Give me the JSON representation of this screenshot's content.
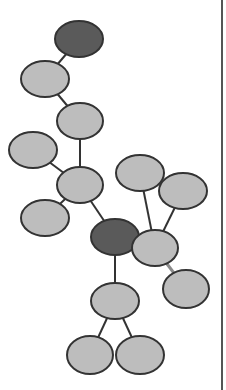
{
  "diagram": {
    "type": "tree-graph",
    "colors": {
      "background": "#ffffff",
      "node_light": "#bdbdbd",
      "node_dark": "#5a5a5a",
      "stroke": "#333333",
      "soft_edge": "#8a8a8a",
      "frame": "#555555"
    },
    "nodes": [
      {
        "id": 1,
        "cx": 79,
        "cy": 39,
        "rx": 24,
        "ry": 18,
        "shade": "dark"
      },
      {
        "id": 2,
        "cx": 45,
        "cy": 79,
        "rx": 24,
        "ry": 18,
        "shade": "light"
      },
      {
        "id": 3,
        "cx": 80,
        "cy": 121,
        "rx": 23,
        "ry": 18,
        "shade": "light"
      },
      {
        "id": 4,
        "cx": 33,
        "cy": 150,
        "rx": 24,
        "ry": 18,
        "shade": "light"
      },
      {
        "id": 5,
        "cx": 80,
        "cy": 185,
        "rx": 23,
        "ry": 18,
        "shade": "light"
      },
      {
        "id": 6,
        "cx": 45,
        "cy": 218,
        "rx": 24,
        "ry": 18,
        "shade": "light"
      },
      {
        "id": 7,
        "cx": 140,
        "cy": 173,
        "rx": 24,
        "ry": 18,
        "shade": "light"
      },
      {
        "id": 8,
        "cx": 183,
        "cy": 191,
        "rx": 24,
        "ry": 18,
        "shade": "light"
      },
      {
        "id": 9,
        "cx": 115,
        "cy": 237,
        "rx": 24,
        "ry": 18,
        "shade": "dark"
      },
      {
        "id": 10,
        "cx": 155,
        "cy": 248,
        "rx": 23,
        "ry": 18,
        "shade": "light"
      },
      {
        "id": 11,
        "cx": 186,
        "cy": 289,
        "rx": 23,
        "ry": 19,
        "shade": "light"
      },
      {
        "id": 12,
        "cx": 115,
        "cy": 301,
        "rx": 24,
        "ry": 18,
        "shade": "light"
      },
      {
        "id": 13,
        "cx": 90,
        "cy": 355,
        "rx": 23,
        "ry": 19,
        "shade": "light"
      },
      {
        "id": 14,
        "cx": 140,
        "cy": 355,
        "rx": 24,
        "ry": 19,
        "shade": "light"
      }
    ],
    "edges": [
      {
        "from": 1,
        "to": 2
      },
      {
        "from": 2,
        "to": 3
      },
      {
        "from": 3,
        "to": 5
      },
      {
        "from": 4,
        "to": 5
      },
      {
        "from": 5,
        "to": 6
      },
      {
        "from": 5,
        "to": 9
      },
      {
        "from": 9,
        "to": 10
      },
      {
        "from": 9,
        "to": 12
      },
      {
        "from": 10,
        "to": 7
      },
      {
        "from": 10,
        "to": 8
      },
      {
        "from": 10,
        "to": 11,
        "style": "soft"
      },
      {
        "from": 12,
        "to": 13
      },
      {
        "from": 12,
        "to": 14
      }
    ],
    "frame_line_x": 222
  }
}
